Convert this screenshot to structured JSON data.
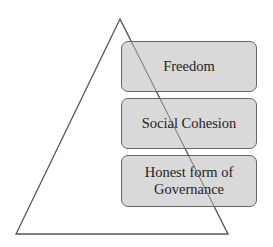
{
  "diagram": {
    "shape": "pyramid-triangle",
    "colors": {
      "box_fill": "#d6d6d6",
      "box_border": "#666666",
      "line": "#555555",
      "text": "#222222"
    },
    "levels": [
      {
        "label": "Freedom"
      },
      {
        "label": "Social Cohesion"
      },
      {
        "label": "Honest form of Governance"
      }
    ]
  }
}
